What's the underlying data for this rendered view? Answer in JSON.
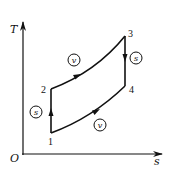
{
  "diagram": {
    "axes": {
      "y_label": "T",
      "x_label": "s",
      "origin_label": "O"
    },
    "points": [
      {
        "id": "1",
        "label": "1"
      },
      {
        "id": "2",
        "label": "2"
      },
      {
        "id": "3",
        "label": "3"
      },
      {
        "id": "4",
        "label": "4"
      }
    ],
    "processes": [
      {
        "from": "1",
        "to": "2",
        "type": "isentropic",
        "symbol": "s"
      },
      {
        "from": "2",
        "to": "3",
        "type": "isochoric",
        "symbol": "v"
      },
      {
        "from": "3",
        "to": "4",
        "type": "isentropic",
        "symbol": "s"
      },
      {
        "from": "4",
        "to": "1",
        "type": "isochoric",
        "symbol": "v"
      }
    ],
    "colors": {
      "line": "#111111",
      "background": "#ffffff"
    }
  }
}
